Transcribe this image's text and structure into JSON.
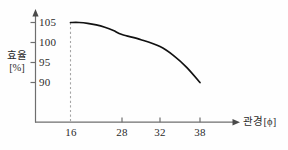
{
  "chart_data": {
    "type": "line",
    "title": "",
    "subtitle": "",
    "xlabel": "관경[ϕ]",
    "ylabel_line1": "효율",
    "ylabel_line2": "[%]",
    "x_ticks": [
      "16",
      "28",
      "32",
      "38"
    ],
    "x_tick_values": [
      16,
      28,
      32,
      38
    ],
    "y_ticks": [
      "105",
      "100",
      "95",
      "90"
    ],
    "y_tick_values": [
      105,
      100,
      95,
      90
    ],
    "ylim": [
      85,
      107
    ],
    "xlim": [
      14,
      40
    ],
    "grid": false,
    "legend": null,
    "legend_position": "none",
    "series": [
      {
        "name": "효율 곡선",
        "x": [
          16,
          18,
          20,
          22,
          24,
          26,
          28,
          30,
          32,
          34,
          36,
          38
        ],
        "values": [
          105,
          105,
          104.8,
          104.4,
          103.8,
          103.0,
          102.0,
          100.7,
          99.0,
          96.8,
          93.8,
          90.0
        ]
      }
    ],
    "annotations": [
      {
        "name": "dashed-guide-line",
        "type": "vertical-dashed",
        "x": 16,
        "from_y": 85,
        "to_y": 105
      }
    ],
    "axis_arrows": {
      "x": "right",
      "y": "up"
    },
    "colors": {
      "curve": "#111111",
      "axis": "#6e6e6e",
      "dash": "#9a9a9a",
      "text": "#2b2b2b",
      "background": "#fefefe"
    }
  }
}
